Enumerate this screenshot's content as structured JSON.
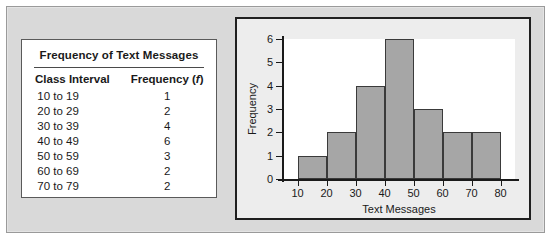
{
  "figure": {
    "table": {
      "title": "Frequency of Text Messages",
      "columns": [
        "Class Interval",
        "Frequency (f)"
      ],
      "column_interval": "Class Interval",
      "column_frequency_prefix": "Frequency (",
      "column_frequency_symbol": "f",
      "column_frequency_suffix": ")",
      "rows": [
        {
          "interval": "10 to 19",
          "frequency": "1"
        },
        {
          "interval": "20 to 29",
          "frequency": "2"
        },
        {
          "interval": "30 to 39",
          "frequency": "4"
        },
        {
          "interval": "40 to 49",
          "frequency": "6"
        },
        {
          "interval": "50 to 59",
          "frequency": "3"
        },
        {
          "interval": "60 to 69",
          "frequency": "2"
        },
        {
          "interval": "70 to 79",
          "frequency": "2"
        }
      ]
    }
  },
  "chart_data": {
    "type": "bar",
    "title": "",
    "xlabel": "Text Messages",
    "ylabel": "Frequency",
    "categories": [
      "10-20",
      "20-30",
      "30-40",
      "40-50",
      "50-60",
      "60-70",
      "70-80"
    ],
    "bin_edges": [
      10,
      20,
      30,
      40,
      50,
      60,
      70,
      80
    ],
    "values": [
      1,
      2,
      4,
      6,
      3,
      2,
      2
    ],
    "xlim": [
      5,
      85
    ],
    "x_ticks": [
      10,
      20,
      30,
      40,
      50,
      60,
      70,
      80
    ],
    "ylim": [
      0,
      6
    ],
    "y_ticks": [
      0,
      1,
      2,
      3,
      4,
      5,
      6
    ],
    "grid": false,
    "legend": false,
    "bar_fill": "#a6a6a6",
    "bar_stroke": "#3a3a3a",
    "plot_background": "#ffffff",
    "panel_background": "#ededed",
    "figure_background": "#d9d9d9"
  }
}
